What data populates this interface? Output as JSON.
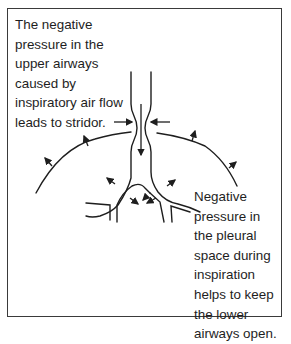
{
  "diagram": {
    "annotations": {
      "upper_airway": "The negative\npressure in the\nupper airways\ncaused by\ninspiratory air flow\nleads to stridor.",
      "lower_airway": "Negative\npressure in\nthe pleural\nspace during\ninspiration\nhelps to keep\nthe lower\nairways open."
    },
    "elements": [
      "trachea-outline",
      "extrathoracic-narrowing",
      "inward-compression-arrows",
      "airflow-arrow-down",
      "pleural-lines",
      "outward-pressure-arrows",
      "bronchial-branches"
    ],
    "colors": {
      "stroke": "#1e1e1e",
      "frame": "#3a3a3a",
      "background": "#ffffff"
    }
  }
}
